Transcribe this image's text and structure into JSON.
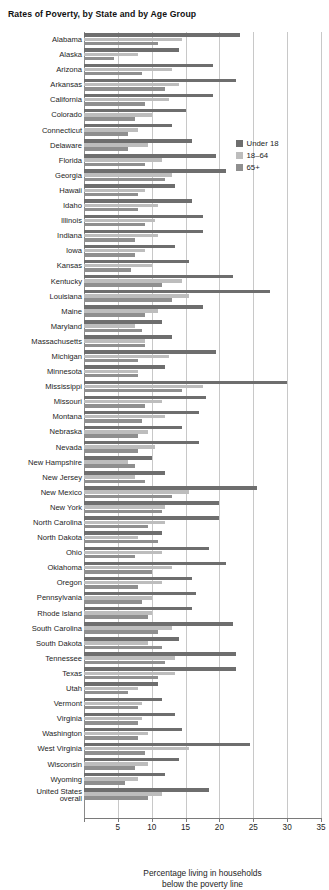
{
  "title": "Rates of Poverty, by State and by Age Group",
  "axis": {
    "xlabel_line1": "Percentage living in households",
    "xlabel_line2": "below the poverty line",
    "ticks": [
      0,
      5,
      10,
      15,
      20,
      25,
      30,
      35
    ],
    "tick_labels": [
      "",
      "5",
      "10",
      "15",
      "20",
      "25",
      "30",
      "35"
    ]
  },
  "legend": {
    "position": "top-right",
    "items": [
      {
        "label": "Under 18",
        "color": "#6e6e6e"
      },
      {
        "label": "18–64",
        "color": "#bdbdbd"
      },
      {
        "label": "65+",
        "color": "#8f8f8f"
      }
    ]
  },
  "chart_data": {
    "type": "bar",
    "orientation": "horizontal",
    "title": "Rates of Poverty, by State and by Age Group",
    "xlabel": "Percentage living in households below the poverty line",
    "ylabel": "",
    "xlim": [
      0,
      35
    ],
    "grid": true,
    "legend_position": "top-right",
    "categories": [
      "Alabama",
      "Alaska",
      "Arizona",
      "Arkansas",
      "California",
      "Colorado",
      "Connecticut",
      "Delaware",
      "Florida",
      "Georgia",
      "Hawaii",
      "Idaho",
      "Illinois",
      "Indiana",
      "Iowa",
      "Kansas",
      "Kentucky",
      "Louisiana",
      "Maine",
      "Maryland",
      "Massachusetts",
      "Michigan",
      "Minnesota",
      "Mississippi",
      "Missouri",
      "Montana",
      "Nebraska",
      "Nevada",
      "New Hampshire",
      "New Jersey",
      "New Mexico",
      "New York",
      "North Carolina",
      "North Dakota",
      "Ohio",
      "Oklahoma",
      "Oregon",
      "Pennsylvania",
      "Rhode Island",
      "South Carolina",
      "South Dakota",
      "Tennessee",
      "Texas",
      "Utah",
      "Vermont",
      "Virginia",
      "Washington",
      "West Virginia",
      "Wisconsin",
      "Wyoming",
      "United States overall"
    ],
    "series": [
      {
        "name": "Under 18",
        "color": "#6e6e6e",
        "values": [
          23.0,
          14.0,
          19.0,
          22.5,
          19.0,
          15.0,
          13.0,
          16.0,
          19.5,
          21.0,
          13.5,
          16.0,
          17.5,
          17.5,
          13.5,
          15.5,
          22.0,
          27.5,
          17.5,
          11.5,
          13.0,
          19.5,
          12.0,
          30.0,
          18.0,
          17.0,
          14.5,
          17.0,
          10.0,
          12.0,
          25.5,
          20.0,
          20.0,
          11.5,
          18.5,
          21.0,
          16.0,
          16.5,
          16.0,
          22.0,
          14.0,
          22.5,
          22.5,
          11.0,
          11.5,
          13.5,
          14.5,
          24.5,
          14.0,
          12.0,
          18.5
        ]
      },
      {
        "name": "18–64",
        "color": "#bdbdbd",
        "values": [
          14.5,
          8.0,
          13.0,
          14.0,
          12.5,
          10.0,
          8.0,
          9.5,
          11.5,
          13.0,
          9.0,
          11.0,
          10.5,
          11.0,
          9.0,
          10.0,
          14.5,
          15.5,
          11.0,
          7.5,
          9.0,
          12.5,
          8.0,
          17.5,
          11.5,
          12.0,
          9.5,
          10.5,
          6.5,
          7.5,
          15.5,
          12.0,
          12.0,
          8.0,
          11.5,
          13.0,
          11.5,
          10.0,
          10.0,
          13.0,
          9.5,
          13.5,
          13.5,
          8.0,
          8.5,
          8.5,
          9.5,
          15.5,
          9.5,
          8.0,
          11.5
        ]
      },
      {
        "name": "65+",
        "color": "#8f8f8f",
        "values": [
          11.0,
          4.5,
          8.5,
          12.0,
          9.0,
          7.5,
          6.5,
          6.5,
          9.0,
          12.0,
          8.0,
          8.0,
          9.0,
          7.5,
          7.5,
          7.0,
          11.5,
          13.0,
          9.0,
          8.5,
          9.0,
          8.0,
          8.0,
          14.5,
          9.0,
          8.5,
          8.0,
          8.0,
          7.5,
          9.0,
          13.0,
          11.5,
          9.5,
          11.0,
          7.5,
          10.0,
          8.0,
          8.5,
          9.5,
          11.0,
          11.5,
          12.0,
          11.0,
          6.5,
          8.0,
          8.0,
          8.0,
          9.0,
          7.5,
          6.0,
          9.5
        ]
      }
    ]
  }
}
